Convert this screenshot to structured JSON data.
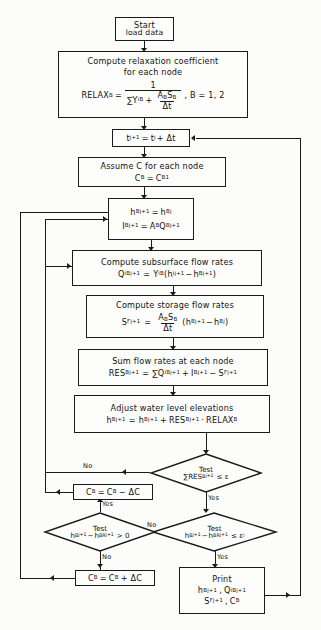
{
  "diagram": {
    "type": "flowchart",
    "ink_color": "#1a1a1a",
    "paper_color": "#fcfcfa"
  },
  "nodes": {
    "start": {
      "shape": "process",
      "line1": "Start",
      "line2": "load data"
    },
    "relax": {
      "shape": "process",
      "line1": "Compute  relaxation  coefficient",
      "line2": "for  each  node",
      "eq_lhs": "RELAX",
      "eq_lhs_sub": "B",
      "eq_eq": "=",
      "eq_num": "1",
      "eq_den_a": "∑Y",
      "eq_den_a_sub": "iB",
      "eq_den_plus": "+",
      "eq_den_frac_num_a": "A",
      "eq_den_frac_num_a_sub": "B",
      "eq_den_frac_num_b": "S",
      "eq_den_frac_num_b_sub": "B",
      "eq_den_frac_den": "Δt",
      "eq_tail": ",  B = 1, 2"
    },
    "timestep": {
      "shape": "process",
      "lhs": "t",
      "lhs_sup": "j+1",
      "eq": "=",
      "rhs": "t",
      "rhs_sup": "j",
      "rhs_tail": "+ Δt"
    },
    "assume_c": {
      "shape": "process",
      "line1": "Assume C for each node",
      "eq_lhs": "C",
      "eq_lhs_sub": "B",
      "eq": "=",
      "eq_rhs": "C",
      "eq_rhs_sub": "B1"
    },
    "init_h_i": {
      "shape": "process",
      "r1_lhs": "h",
      "r1_lhs_sub": "B",
      "r1_lhs_sup": "j+1",
      "r1_eq": "=",
      "r1_rhs": "h",
      "r1_rhs_sub": "B",
      "r1_rhs_sup": "j",
      "r2_lhs": "I",
      "r2_lhs_sub": "B",
      "r2_lhs_sup": "j+1",
      "r2_eq": "=",
      "r2_rhs_a": "A",
      "r2_rhs_a_sub": "B",
      "r2_rhs_b": "Q",
      "r2_rhs_b_sub": "B",
      "r2_rhs_b_sup": "j+1"
    },
    "subsurface": {
      "shape": "process",
      "title": "Compute subsurface flow rates",
      "lhs": "Q",
      "lhs_sub": "iB",
      "lhs_sup": "j+1",
      "eq": "=",
      "coef": "Y",
      "coef_sub": "iB",
      "open": "(",
      "t1": "h",
      "t1_sub": "i",
      "t1_sup": "j+1",
      "minus": "−",
      "t2": "h",
      "t2_sub": "B",
      "t2_sup": "j+1",
      "close": ")"
    },
    "storage": {
      "shape": "process",
      "title": "Compute storage flow rates",
      "lhs": "S",
      "lhs_sub": "F",
      "lhs_sup": "j+1",
      "eq": "=",
      "frac_num_a": "A",
      "frac_num_a_sub": "B",
      "frac_num_b": "S",
      "frac_num_b_sub": "B",
      "frac_den": "Δt",
      "open": "(",
      "t1": "h",
      "t1_sub": "B",
      "t1_sup": "j+1",
      "minus": "−",
      "t2": "h",
      "t2_sub": "B",
      "t2_sup": "j",
      "close": ")"
    },
    "sum_rates": {
      "shape": "process",
      "title": "Sum flow rates at each node",
      "lhs": "RES",
      "lhs_sub": "B",
      "lhs_sup": "j+1",
      "eq": "=",
      "sigma": "∑",
      "t1": "Q",
      "t1_sub": "iB",
      "t1_sup": "j+1",
      "plus": "+",
      "t2": "I",
      "t2_sub": "B",
      "t2_sup": "j+1",
      "minus": "−",
      "t3": "S",
      "t3_sub": "F",
      "t3_sup": "j+1"
    },
    "adjust": {
      "shape": "process",
      "title": "Adjust water level elevations",
      "lhs": "h",
      "lhs_sub": "B",
      "lhs_sup": "j+1",
      "eq": "=",
      "t1": "h",
      "t1_sub": "B",
      "t1_sup": "j+1",
      "plus": "+",
      "t2": "RES",
      "t2_sub": "B",
      "t2_sup": "j+1",
      "dot": "·",
      "t3": "RELAX",
      "t3_sub": "B"
    },
    "c_minus": {
      "shape": "process",
      "lhs": "C",
      "lhs_sub": "B",
      "eq": "=",
      "rhs": "C",
      "rhs_sub": "B",
      "op": "− ΔC"
    },
    "c_plus": {
      "shape": "process",
      "lhs": "C",
      "lhs_sub": "B",
      "eq": "=",
      "rhs": "C",
      "rhs_sub": "B",
      "op": "+ ΔC"
    },
    "print": {
      "shape": "process",
      "title": "Print",
      "r1_a": "h",
      "r1_a_sub": "B",
      "r1_a_sup": "j+1",
      "r1_comma": ",",
      "r1_b": "Q",
      "r1_b_sub": "iB",
      "r1_b_sup": "j+1",
      "r2_a": "S",
      "r2_a_sub": "F",
      "r2_a_sup": "j+1",
      "r2_comma": ",",
      "r2_b": "C",
      "r2_b_sub": "B"
    }
  },
  "decisions": {
    "test_res": {
      "shape": "decision",
      "title": "Test",
      "sigma": "∑",
      "lhs": "RES",
      "lhs_sub": "B",
      "lhs_sup": "j+1",
      "op": "≤ ε",
      "yes_label": "Yes",
      "no_label": "No"
    },
    "test_gt0": {
      "shape": "decision",
      "title": "Test",
      "t1": "h",
      "t1_sub": "B",
      "t1_sup": "j+1",
      "minus": "−",
      "t2": "h",
      "t2_sub": "BR",
      "t2_sup": "j+1",
      "op": "> 0",
      "yes_label": "Yes",
      "no_label": "No"
    },
    "test_eps": {
      "shape": "decision",
      "title": "Test",
      "t1": "h",
      "t1_sub": "B",
      "t1_sup": "j+1",
      "minus": "−",
      "t2": "h",
      "t2_sub": "BR",
      "t2_sup": "j+1",
      "op": "≤ ε",
      "op_sub": "i",
      "yes_label": "Yes",
      "no_label": "No"
    }
  },
  "edge_labels": {
    "res_no": "No",
    "res_yes": "Yes",
    "gt0_yes": "Yes",
    "gt0_no": "No",
    "eps_no": "No",
    "eps_yes": "Yes"
  }
}
